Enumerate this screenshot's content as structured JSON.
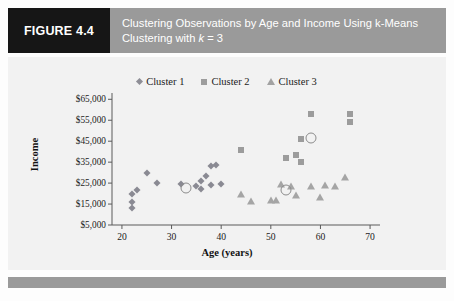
{
  "header": {
    "figure_label": "FIGURE 4.4",
    "title_line1": "Clustering Observations by Age and Income Using k-Means",
    "title_line2_pre": "Clustering with ",
    "title_line2_k": "k",
    "title_line2_post": " = 3",
    "bar_color": "#9a9a9a",
    "label_bg": "#161616"
  },
  "chart_data": {
    "type": "scatter",
    "title": "Clustering Observations by Age and Income Using k-Means Clustering with k = 3",
    "xlabel": "Age (years)",
    "ylabel": "Income",
    "xlim": [
      18,
      72
    ],
    "ylim": [
      5000,
      68000
    ],
    "grid": false,
    "legend_position": "top-center",
    "xticks": [
      20,
      30,
      40,
      50,
      60,
      70
    ],
    "xtick_labels": [
      "20",
      "30",
      "40",
      "50",
      "60",
      "70"
    ],
    "yticks": [
      5000,
      15000,
      25000,
      35000,
      45000,
      55000,
      65000
    ],
    "ytick_labels": [
      "$5,000",
      "$15,000",
      "$25,000",
      "$35,000",
      "$45,000",
      "$55,000",
      "$65,000"
    ],
    "series": [
      {
        "name": "Cluster 1",
        "marker": "diamond",
        "color": "#8a8a93",
        "points": [
          [
            22,
            20000
          ],
          [
            22,
            16000
          ],
          [
            22,
            13000
          ],
          [
            23,
            21500
          ],
          [
            25,
            30000
          ],
          [
            27,
            25000
          ],
          [
            32,
            24500
          ],
          [
            35,
            23500
          ],
          [
            36,
            22000
          ],
          [
            36,
            26000
          ],
          [
            37,
            28500
          ],
          [
            38,
            24000
          ],
          [
            38,
            33000
          ],
          [
            39,
            33500
          ],
          [
            40,
            24500
          ]
        ]
      },
      {
        "name": "Cluster 2",
        "marker": "square",
        "color": "#9c9c9c",
        "points": [
          [
            44,
            41000
          ],
          [
            53,
            37000
          ],
          [
            55,
            38500
          ],
          [
            56,
            35000
          ],
          [
            56,
            46000
          ],
          [
            58,
            58000
          ],
          [
            66,
            58000
          ],
          [
            66,
            54000
          ]
        ]
      },
      {
        "name": "Cluster 3",
        "marker": "triangle",
        "color": "#a5a5a5",
        "points": [
          [
            44,
            20000
          ],
          [
            46,
            16500
          ],
          [
            50,
            17000
          ],
          [
            51,
            17000
          ],
          [
            52,
            24500
          ],
          [
            54,
            23500
          ],
          [
            55,
            19500
          ],
          [
            58,
            23500
          ],
          [
            60,
            18500
          ],
          [
            61,
            24000
          ],
          [
            63,
            23500
          ],
          [
            65,
            28000
          ]
        ]
      }
    ],
    "centroids": [
      {
        "label": "Cluster 1 centroid",
        "x": 33,
        "y": 22500
      },
      {
        "label": "Cluster 2 centroid",
        "x": 58,
        "y": 46500
      },
      {
        "label": "Cluster 3 centroid",
        "x": 53,
        "y": 21500
      }
    ]
  }
}
